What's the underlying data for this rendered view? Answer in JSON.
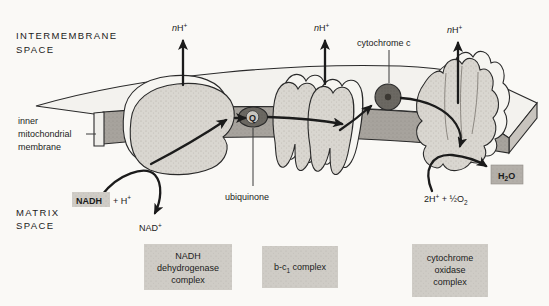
{
  "figure_title": "electron-transport-chain-inner-mitochondrial-membrane",
  "labels": {
    "intermembrane": [
      "INTERMEMBRANE",
      "SPACE"
    ],
    "matrix": [
      "MATRIX",
      "SPACE"
    ],
    "membrane": [
      "inner",
      "mitochondrial",
      "membrane"
    ],
    "proton": {
      "n": "n",
      "h": "H",
      "sup": "+"
    },
    "cytochrome_c": "cytochrome c",
    "ubiquinone": "ubiquinone",
    "q_carrier": "Q",
    "nadh": "NADH",
    "nadh_rest": {
      "t": "+ H",
      "sup": "+"
    },
    "nad": {
      "t": "NAD",
      "sup": "+"
    },
    "oxygen": {
      "t1": "2H",
      "sup": "+",
      "t2": " + ½O",
      "sub": "2"
    },
    "water": {
      "t1": "H",
      "sub": "2",
      "t2": "O"
    }
  },
  "boxes": {
    "complex1": [
      "NADH",
      "dehydrogenase",
      "complex"
    ],
    "complex2": {
      "t1": "b-c",
      "sub": "1",
      "t2": " complex"
    },
    "complex3": [
      "cytochrome",
      "oxidase",
      "complex"
    ]
  },
  "colors": {
    "background": "#faf9f6",
    "complex_fill": "#d9d6d0",
    "membrane_fill": "#a7a39d",
    "carrier_fill": "#6b6862",
    "label_box_fill": "#cfccc6",
    "water_box_fill": "#b3afa9",
    "ink": "#1b1b1b"
  }
}
